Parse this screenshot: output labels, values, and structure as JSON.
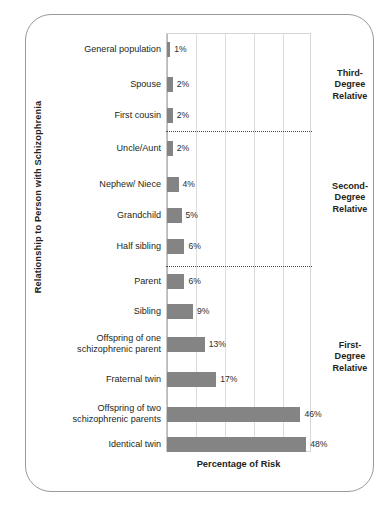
{
  "chart_data": {
    "type": "bar",
    "orientation": "horizontal",
    "title": "",
    "xlabel": "Percentage of Risk",
    "ylabel": "Relationship to Person with Schizophrenia",
    "xlim": [
      0,
      50
    ],
    "grid": true,
    "gridlines": [
      0,
      10,
      20,
      30,
      40,
      50
    ],
    "legend": "none",
    "categories": [
      "General population",
      "Spouse",
      "First cousin",
      "Uncle/Aunt",
      "Nephew/ Niece",
      "Grandchild",
      "Half sibling",
      "Parent",
      "Sibling",
      "Offspring of one schizophrenic parent",
      "Fraternal twin",
      "Offspring of two schizophrenic parents",
      "Identical twin"
    ],
    "values": [
      1,
      2,
      2,
      2,
      4,
      5,
      6,
      6,
      9,
      13,
      17,
      46,
      48
    ],
    "value_labels": [
      "1%",
      "2%",
      "2%",
      "2%",
      "4%",
      "5%",
      "6%",
      "6%",
      "9%",
      "13%",
      "17%",
      "46%",
      "48%"
    ],
    "bar_color": "#848484",
    "annotations": [
      {
        "text": "Third-Degree Relative",
        "lines": [
          "Third-",
          "Degree",
          "Relative"
        ],
        "covers": [
          0,
          2
        ]
      },
      {
        "text": "Second-Degree Relative",
        "lines": [
          "Second-",
          "Degree",
          "Relative"
        ],
        "covers": [
          3,
          6
        ]
      },
      {
        "text": "First-Degree Relative",
        "lines": [
          "First-",
          "Degree",
          "Relative"
        ],
        "covers": [
          7,
          12
        ]
      }
    ],
    "separators": [
      "after First cousin",
      "after Half sibling"
    ]
  },
  "axis": {
    "y_title": "Relationship to Person with Schizophrenia",
    "x_title": "Percentage of Risk"
  },
  "bars": [
    {
      "label": "General population",
      "value": 1,
      "value_label": "1%",
      "multiline": false
    },
    {
      "label": "Spouse",
      "value": 2,
      "value_label": "2%",
      "multiline": false
    },
    {
      "label": "First cousin",
      "value": 2,
      "value_label": "2%",
      "multiline": false
    },
    {
      "label": "Uncle/Aunt",
      "value": 2,
      "value_label": "2%",
      "multiline": false
    },
    {
      "label": "Nephew/ Niece",
      "value": 4,
      "value_label": "4%",
      "multiline": false
    },
    {
      "label": "Grandchild",
      "value": 5,
      "value_label": "5%",
      "multiline": false
    },
    {
      "label": "Half sibling",
      "value": 6,
      "value_label": "6%",
      "multiline": false
    },
    {
      "label": "Parent",
      "value": 6,
      "value_label": "6%",
      "multiline": false
    },
    {
      "label": "Sibling",
      "value": 9,
      "value_label": "9%",
      "multiline": false
    },
    {
      "label": "Offspring of one\nschizophrenic parent",
      "label_line1": "Offspring of one",
      "label_line2": "schizophrenic parent",
      "value": 13,
      "value_label": "13%",
      "multiline": true
    },
    {
      "label": "Fraternal twin",
      "value": 17,
      "value_label": "17%",
      "multiline": false
    },
    {
      "label": "Offspring of two\nschizophrenic parents",
      "label_line1": "Offspring of two",
      "label_line2": "schizophrenic parents",
      "value": 46,
      "value_label": "46%",
      "multiline": true
    },
    {
      "label": "Identical twin",
      "value": 48,
      "value_label": "48%",
      "multiline": false
    }
  ],
  "groups": [
    {
      "l1": "Third-",
      "l2": "Degree",
      "l3": "Relative"
    },
    {
      "l1": "Second-",
      "l2": "Degree",
      "l3": "Relative"
    },
    {
      "l1": "First-",
      "l2": "Degree",
      "l3": "Relative"
    }
  ],
  "colors": {
    "bar": "#848484",
    "grid": "#dcdcdc",
    "frame": "#9a9a9a",
    "text": "#231f20"
  }
}
